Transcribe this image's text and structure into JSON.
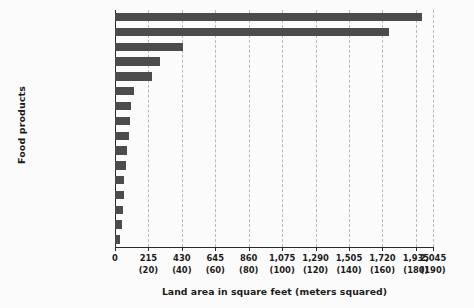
{
  "chart_data": {
    "type": "bar",
    "orientation": "horizontal",
    "title": "",
    "xlabel": "Land area in square feet (meters squared)",
    "ylabel": "Food products",
    "xlim": [
      0,
      2045
    ],
    "grid": true,
    "legend": null,
    "bar_color": "#4c4c4c",
    "background_color": "#fbfbfb",
    "axis_color": "#2a2a2a",
    "gridline_color": "#b9b9b9",
    "xticks": [
      {
        "value": 0,
        "label": "0",
        "sublabel": ""
      },
      {
        "value": 215,
        "label": "215",
        "sublabel": "(20)"
      },
      {
        "value": 430,
        "label": "430",
        "sublabel": "(40)"
      },
      {
        "value": 645,
        "label": "645",
        "sublabel": "(60)"
      },
      {
        "value": 860,
        "label": "860",
        "sublabel": "(80)"
      },
      {
        "value": 1075,
        "label": "1,075",
        "sublabel": "(100)"
      },
      {
        "value": 1290,
        "label": "1,290",
        "sublabel": "(120)"
      },
      {
        "value": 1505,
        "label": "1,505",
        "sublabel": "(140)"
      },
      {
        "value": 1720,
        "label": "1,720",
        "sublabel": "(160)"
      },
      {
        "value": 1935,
        "label": "1,935",
        "sublabel": "(180)"
      },
      {
        "value": 2045,
        "label": "2,045",
        "sublabel": "(190)"
      }
    ],
    "categories": [
      "Lamb and mutton",
      "Beef (beef herd)",
      "Cheese",
      "Milk",
      "Beef (dairy herd)",
      "Pork",
      "Nuts",
      "Other pulses",
      "Poultry meat",
      "Eggs",
      "Grains",
      "Fish (farmed)",
      "Groundnuts",
      "Peas",
      "Tofu (soybeans)",
      "Shrimp (farmed)"
    ],
    "values": [
      1975,
      1765,
      435,
      290,
      240,
      120,
      100,
      95,
      90,
      80,
      70,
      60,
      55,
      50,
      45,
      30
    ]
  }
}
